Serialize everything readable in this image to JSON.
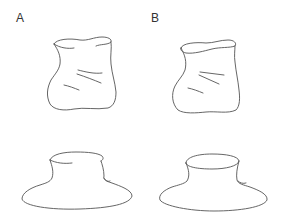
{
  "figure": {
    "panels": [
      {
        "label": "A",
        "objects": [
          "crumpled-jar",
          "hat-shaped-vessel"
        ]
      },
      {
        "label": "B",
        "objects": [
          "crumpled-jar",
          "hat-shaped-vessel"
        ]
      }
    ],
    "colors": {
      "background": "#ffffff",
      "line": "#555555",
      "label": "#333333"
    }
  }
}
